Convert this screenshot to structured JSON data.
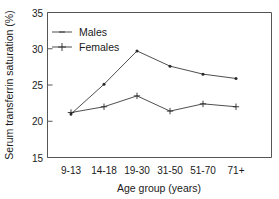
{
  "chart_data": {
    "type": "line",
    "title": "",
    "xlabel": "Age group (years)",
    "ylabel": "Serum transferrin saturation (%)",
    "categories": [
      "9-13",
      "14-18",
      "19-30",
      "31-50",
      "51-70",
      "71+"
    ],
    "ylim": [
      15,
      35
    ],
    "yticks": [
      15,
      20,
      25,
      30,
      35
    ],
    "ytick_labels": [
      "15",
      "20",
      "25",
      "30",
      "35"
    ],
    "grid": false,
    "legend_position": "top-left",
    "series": [
      {
        "name": "Males",
        "values": [
          21.0,
          25.1,
          29.7,
          27.6,
          26.5,
          25.9
        ],
        "color": "#3a3a3a",
        "marker": "point"
      },
      {
        "name": "Females",
        "values": [
          21.2,
          22.0,
          23.5,
          21.4,
          22.4,
          22.0
        ],
        "color": "#3a3a3a",
        "marker": "plus"
      }
    ]
  },
  "axes": {
    "y_title": "Serum transferrin saturation (%)",
    "x_title": "Age group (years)"
  },
  "legend": {
    "items": [
      {
        "label": "Males"
      },
      {
        "label": "Females"
      }
    ]
  }
}
